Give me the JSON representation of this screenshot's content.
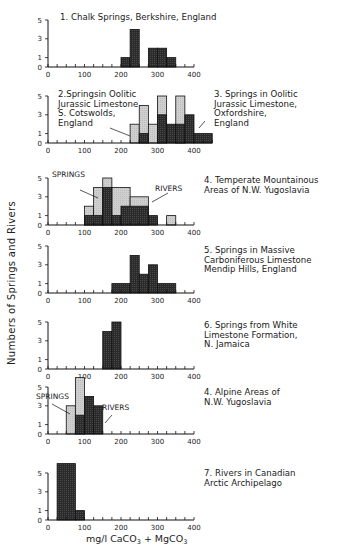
{
  "figure": {
    "ylabel": "Numbers of Springs and Rivers",
    "xlabel_main": "mg/l  CaCO",
    "xlabel_sub1": "3",
    "xlabel_mid": " + MgCO",
    "xlabel_sub2": "3"
  },
  "colors": {
    "springs_fill": "#c9c9c9",
    "rivers_fill": "#2e2e2e",
    "axis": "#1a1a1a"
  },
  "chart_data": [
    {
      "type": "bar",
      "id": "panel-1",
      "title": "1. Chalk Springs, Berkshire, England",
      "xlabel": "",
      "ylabel": "Numbers of Springs and Rivers",
      "xlim": [
        0,
        400
      ],
      "ylim": [
        0,
        5
      ],
      "x_ticks": [
        0,
        100,
        200,
        300,
        400
      ],
      "y_ticks": [
        0,
        1,
        3,
        5
      ],
      "bin_width": 25,
      "series": [
        {
          "name": "Springs",
          "style": "dark",
          "bins": [
            [
              200,
              225,
              1
            ],
            [
              225,
              250,
              4
            ],
            [
              275,
              300,
              2
            ],
            [
              300,
              325,
              2
            ],
            [
              325,
              350,
              1
            ]
          ]
        }
      ]
    },
    {
      "type": "bar",
      "id": "panel-2-3",
      "title": "2. Springs in Oolitic Jurassic Limestone, S. Cotswolds, England / 3. Springs in Oolitic Jurassic Limestone, Oxfordshire, England",
      "xlim": [
        0,
        450
      ],
      "ylim": [
        0,
        5
      ],
      "x_ticks": [
        0,
        100,
        200,
        300,
        400
      ],
      "y_ticks": [
        0,
        1,
        3,
        5
      ],
      "bin_width": 25,
      "series": [
        {
          "name": "2. S. Cotswolds (light)",
          "style": "light",
          "bins": [
            [
              225,
              250,
              2
            ],
            [
              250,
              275,
              4
            ],
            [
              275,
              300,
              2
            ],
            [
              300,
              325,
              5
            ],
            [
              350,
              375,
              5
            ]
          ]
        },
        {
          "name": "3. Oxfordshire (dark)",
          "style": "dark",
          "bins": [
            [
              250,
              275,
              1
            ],
            [
              300,
              325,
              3
            ],
            [
              325,
              350,
              2
            ],
            [
              350,
              375,
              2
            ],
            [
              375,
              400,
              3
            ],
            [
              400,
              450,
              1
            ]
          ]
        }
      ]
    },
    {
      "type": "bar",
      "id": "panel-4a",
      "title": "4. Temperate Mountainous Areas of N.W. Yugoslavia",
      "xlim": [
        0,
        400
      ],
      "ylim": [
        0,
        5
      ],
      "x_ticks": [
        0,
        100,
        200,
        300,
        400
      ],
      "y_ticks": [
        0,
        1,
        3,
        5
      ],
      "bin_width": 25,
      "series": [
        {
          "name": "Springs",
          "style": "light",
          "bins": [
            [
              100,
              125,
              2
            ],
            [
              125,
              150,
              4
            ],
            [
              150,
              175,
              5
            ],
            [
              175,
              225,
              4
            ],
            [
              225,
              275,
              3
            ],
            [
              325,
              350,
              1
            ]
          ]
        },
        {
          "name": "Rivers",
          "style": "dark",
          "bins": [
            [
              100,
              150,
              1
            ],
            [
              150,
              175,
              4
            ],
            [
              175,
              200,
              1
            ],
            [
              200,
              275,
              2
            ],
            [
              275,
              300,
              1
            ]
          ]
        }
      ]
    },
    {
      "type": "bar",
      "id": "panel-5",
      "title": "5. Springs in Massive Carboniferous Limestone Mendip Hills, England",
      "xlim": [
        0,
        400
      ],
      "ylim": [
        0,
        5
      ],
      "x_ticks": [
        0,
        100,
        200,
        300,
        400
      ],
      "y_ticks": [
        0,
        1,
        3,
        5
      ],
      "bin_width": 25,
      "series": [
        {
          "name": "Springs",
          "style": "dark",
          "bins": [
            [
              175,
              225,
              1
            ],
            [
              225,
              250,
              4
            ],
            [
              250,
              275,
              2
            ],
            [
              275,
              300,
              3
            ],
            [
              300,
              350,
              1
            ]
          ]
        }
      ]
    },
    {
      "type": "bar",
      "id": "panel-6",
      "title": "6. Springs from White Limestone Formation, N. Jamaica",
      "xlim": [
        0,
        400
      ],
      "ylim": [
        0,
        5
      ],
      "x_ticks": [
        0,
        100,
        200,
        300,
        400
      ],
      "y_ticks": [
        0,
        1,
        3,
        5
      ],
      "bin_width": 25,
      "series": [
        {
          "name": "Springs",
          "style": "dark",
          "bins": [
            [
              150,
              175,
              4
            ],
            [
              175,
              200,
              5
            ]
          ]
        }
      ]
    },
    {
      "type": "bar",
      "id": "panel-4b",
      "title": "4. Alpine Areas of N.W. Yugoslavia",
      "xlim": [
        0,
        400
      ],
      "ylim": [
        0,
        5
      ],
      "x_ticks": [
        0,
        100,
        200,
        300,
        400
      ],
      "y_ticks": [
        0,
        1,
        3,
        5
      ],
      "bin_width": 25,
      "series": [
        {
          "name": "Springs",
          "style": "light",
          "bins": [
            [
              50,
              75,
              3
            ],
            [
              75,
              100,
              6
            ]
          ]
        },
        {
          "name": "Rivers",
          "style": "dark",
          "bins": [
            [
              75,
              100,
              2
            ],
            [
              100,
              125,
              4
            ],
            [
              125,
              150,
              3
            ]
          ]
        }
      ]
    },
    {
      "type": "bar",
      "id": "panel-7",
      "title": "7. Rivers in Canadian Arctic Archipelago",
      "xlabel": "mg/l CaCO3 + MgCO3",
      "xlim": [
        0,
        400
      ],
      "ylim": [
        0,
        5
      ],
      "x_ticks": [
        0,
        100,
        200,
        300,
        400
      ],
      "y_ticks": [
        0,
        1,
        3,
        5
      ],
      "bin_width": 25,
      "series": [
        {
          "name": "Rivers",
          "style": "dark",
          "bins": [
            [
              25,
              75,
              6
            ],
            [
              75,
              100,
              1
            ]
          ]
        }
      ]
    }
  ],
  "panels_layout": [
    {
      "base_y": 67,
      "title_lines": [
        "1. Chalk Springs, Berkshire, England"
      ],
      "title_x": 60,
      "title_y": 20,
      "x_end": 400
    },
    {
      "base_y": 143,
      "title_lines": [
        "2.Springsin Oolitic",
        "Jurassic Limestone",
        "S. Cotswolds,",
        "England"
      ],
      "title_x": 58,
      "title_y": 97,
      "title2_lines": [
        "3. Springs in Oolitic",
        "Jurassic Limestone,",
        "Oxfordshire,",
        "England"
      ],
      "title2_x": 214,
      "title2_y": 97,
      "x_end": 450
    },
    {
      "base_y": 225,
      "title_lines": [
        "4. Temperate Mountainous",
        "   Areas of N.W. Yugoslavia"
      ],
      "title_x": 204,
      "title_y": 183,
      "labels": [
        {
          "text": "SPRINGS",
          "x": 52,
          "y": 177
        },
        {
          "text": "RIVERS",
          "x": 155,
          "y": 191
        }
      ],
      "x_end": 400
    },
    {
      "base_y": 293,
      "title_lines": [
        "5. Springs in Massive",
        "   Carboniferous Limestone",
        "   Mendip Hills, England"
      ],
      "title_x": 204,
      "title_y": 253,
      "x_end": 400
    },
    {
      "base_y": 369,
      "title_lines": [
        "6. Springs from White",
        "   Limestone Formation,",
        "   N. Jamaica"
      ],
      "title_x": 204,
      "title_y": 328,
      "x_end": 400
    },
    {
      "base_y": 434,
      "title_lines": [
        "4. Alpine Areas of",
        "   N.W. Yugoslavia"
      ],
      "title_x": 204,
      "title_y": 395,
      "labels": [
        {
          "text": "SPRINGS",
          "x": 36,
          "y": 399
        },
        {
          "text": "RIVERS",
          "x": 102,
          "y": 410
        }
      ],
      "x_end": 400
    },
    {
      "base_y": 520,
      "title_lines": [
        "7. Rivers in Canadian",
        "   Arctic Archipelago"
      ],
      "title_x": 204,
      "title_y": 476,
      "x_end": 400
    }
  ]
}
